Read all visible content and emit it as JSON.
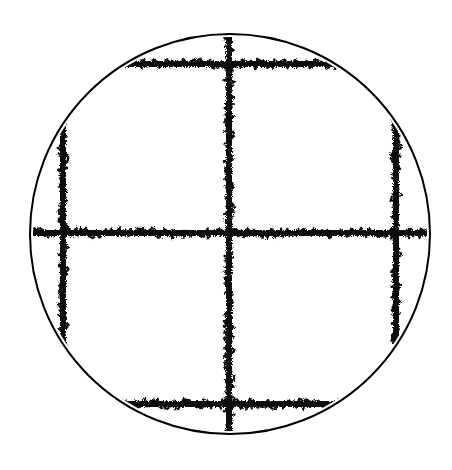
{
  "diagram": {
    "circle": {
      "cx": 230,
      "cy": 234,
      "r": 200,
      "stroke": "#000000",
      "stroke_width": 2
    },
    "grid": {
      "horizontal_y": [
        64,
        233,
        404
      ],
      "vertical_x": [
        63,
        229,
        396
      ],
      "color": "#111111",
      "style": "scribble"
    },
    "background": "#ffffff"
  }
}
